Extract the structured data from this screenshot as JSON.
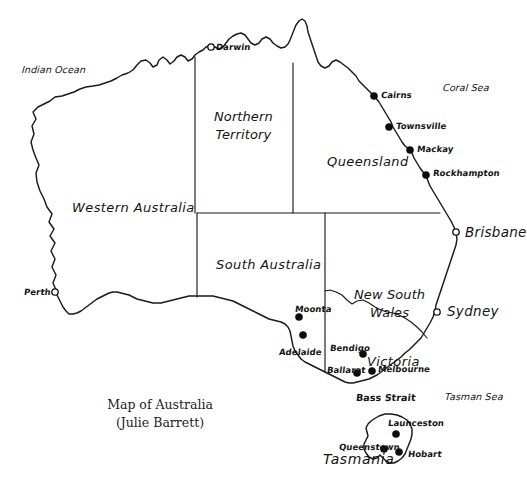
{
  "title": {
    "line1": "Map of Australia",
    "line2": "(Julie Barrett)"
  },
  "colors": {
    "background": "#ffffff",
    "ink": "#1a1a1a",
    "marker_fill": "#0d0d0d"
  },
  "states": [
    {
      "name": "Western Australia",
      "label": "Western Australia",
      "x": 72,
      "y": 201
    },
    {
      "name": "Northern Territory",
      "line1": "Northern",
      "line2": "Territory",
      "x": 214,
      "y": 108
    },
    {
      "name": "South Australia",
      "label": "South Australia",
      "x": 216,
      "y": 258
    },
    {
      "name": "Queensland",
      "label": "Queensland",
      "x": 327,
      "y": 155
    },
    {
      "name": "New South Wales",
      "line1": "New South",
      "line2": "Wales",
      "x": 354,
      "y": 286
    },
    {
      "name": "Victoria",
      "label": "Victoria",
      "x": 367,
      "y": 355
    },
    {
      "name": "Tasmania",
      "label": "Tasmania",
      "x": 323,
      "y": 452
    }
  ],
  "seas": [
    {
      "name": "Indian Ocean",
      "label": "Indian Ocean",
      "x": 22,
      "y": 65
    },
    {
      "name": "Coral Sea",
      "label": "Coral Sea",
      "x": 443,
      "y": 83
    },
    {
      "name": "Tasman Sea",
      "label": "Tasman Sea",
      "x": 445,
      "y": 392
    },
    {
      "name": "Bass Strait",
      "label": "Bass Strait",
      "x": 356,
      "y": 393
    }
  ],
  "cities": [
    {
      "name": "Darwin",
      "label": "Darwin",
      "marker": "hollow",
      "mx": 211,
      "my": 47,
      "lx": 216,
      "ly": 43,
      "size": "small"
    },
    {
      "name": "Cairns",
      "label": "Cairns",
      "marker": "filled",
      "mx": 374,
      "my": 96,
      "lx": 381,
      "ly": 91,
      "size": "small"
    },
    {
      "name": "Townsville",
      "label": "Townsville",
      "marker": "filled",
      "mx": 389,
      "my": 127,
      "lx": 396,
      "ly": 122,
      "size": "small"
    },
    {
      "name": "Mackay",
      "label": "Mackay",
      "marker": "filled",
      "mx": 410,
      "my": 150,
      "lx": 417,
      "ly": 145,
      "size": "small"
    },
    {
      "name": "Rockhampton",
      "label": "Rockhampton",
      "marker": "filled",
      "mx": 426,
      "my": 175,
      "lx": 433,
      "ly": 169,
      "size": "small"
    },
    {
      "name": "Brisbane",
      "label": "Brisbane",
      "marker": "hollow",
      "mx": 456,
      "my": 232,
      "lx": 465,
      "ly": 226,
      "size": "big"
    },
    {
      "name": "Sydney",
      "label": "Sydney",
      "marker": "hollow",
      "mx": 437,
      "my": 312,
      "lx": 447,
      "ly": 305,
      "size": "big"
    },
    {
      "name": "Perth",
      "label": "Perth",
      "marker": "hollow",
      "mx": 55,
      "my": 292,
      "lx": 24,
      "ly": 288,
      "size": "small"
    },
    {
      "name": "Moonta",
      "label": "Moonta",
      "marker": "filled",
      "mx": 299,
      "my": 317,
      "lx": 295,
      "ly": 305,
      "size": "small"
    },
    {
      "name": "Adelaide",
      "label": "Adelaide",
      "marker": "filled",
      "mx": 303,
      "my": 335,
      "lx": 279,
      "ly": 348,
      "size": "small"
    },
    {
      "name": "Bendigo",
      "label": "Bendigo",
      "marker": "filled",
      "mx": 363,
      "my": 354,
      "lx": 330,
      "ly": 344,
      "size": "small"
    },
    {
      "name": "Ballarat",
      "label": "Ballarat",
      "marker": "filled",
      "mx": 357,
      "my": 373,
      "lx": 327,
      "ly": 366,
      "size": "small"
    },
    {
      "name": "Melbourne",
      "label": "Melbourne",
      "marker": "filled",
      "mx": 372,
      "my": 371,
      "lx": 378,
      "ly": 365,
      "size": "small"
    },
    {
      "name": "Launceston",
      "label": "Launceston",
      "marker": "filled",
      "mx": 396,
      "my": 434,
      "lx": 388,
      "ly": 419,
      "size": "small"
    },
    {
      "name": "Queenstown",
      "label": "Queenstown",
      "marker": "filled",
      "mx": 384,
      "my": 449,
      "lx": 339,
      "ly": 443,
      "size": "small"
    },
    {
      "name": "Hobart",
      "label": "Hobart",
      "marker": "filled",
      "mx": 399,
      "my": 452,
      "lx": 408,
      "ly": 450,
      "size": "small"
    }
  ],
  "geometry": {
    "mainland": "M 56 290 L 53 283 L 56 275 L 52 267 L 55 259 L 51 251 L 55 243 L 50 236 L 54 229 L 49 222 L 52 214 L 47 207 L 44 199 L 40 191 L 37 182 L 36 173 L 39 165 L 36 158 L 33 150 L 31 142 L 34 134 L 32 126 L 36 119 L 33 112 L 38 107 L 44 104 L 50 101 L 55 97 L 62 96 L 68 94 L 74 92 L 80 89 L 86 87 L 93 86 L 99 85 L 105 83 L 111 81 L 117 78 L 122 75 L 128 73 L 133 70 L 137 65 L 141 61 L 146 60 L 150 63 L 153 67 L 157 65 L 159 60 L 163 57 L 167 60 L 170 64 L 174 61 L 177 57 L 181 55 L 185 57 L 188 61 L 192 59 L 195 55 L 199 52 L 203 50 L 206 47 L 210 46 L 215 47 L 219 49 L 223 47 L 226 43 L 229 39 L 233 36 L 237 34 L 241 33 L 245 35 L 248 39 L 251 43 L 255 45 L 259 43 L 262 39 L 266 37 L 270 39 L 273 43 L 277 46 L 281 48 L 285 47 L 288 44 L 290 40 L 292 35 L 294 30 L 296 25 L 299 21 L 302 19 L 305 21 L 307 26 L 308 32 L 310 38 L 312 44 L 314 50 L 316 56 L 318 62 L 321 66 L 325 68 L 329 66 L 332 62 L 336 60 L 340 62 L 344 65 L 348 68 L 352 72 L 356 76 L 359 81 L 363 85 L 367 89 L 371 93 L 375 97 L 379 102 L 382 107 L 385 112 L 388 117 L 391 122 L 393 127 L 396 132 L 399 137 L 402 142 L 405 146 L 409 149 L 412 153 L 414 158 L 417 163 L 420 168 L 423 172 L 426 176 L 428 181 L 430 186 L 433 191 L 436 196 L 439 201 L 442 206 L 445 211 L 448 216 L 451 221 L 454 227 L 456 233 L 457 239 L 456 245 L 454 251 L 452 257 L 450 263 L 448 269 L 446 275 L 444 281 L 442 287 L 440 293 L 438 299 L 436 305 L 435 311 L 433 317 L 430 323 L 427 328 L 424 333 L 421 338 L 417 342 L 413 346 L 409 350 L 405 353 L 401 357 L 397 360 L 393 363 L 389 366 L 385 369 L 381 372 L 377 375 L 373 377 L 369 379 L 365 380 L 361 381 L 357 382 L 353 383 L 349 383 L 345 382 L 341 380 L 337 378 L 333 376 L 329 374 L 325 372 L 321 370 L 317 368 L 313 366 L 309 364 L 305 362 L 301 359 L 298 355 L 295 351 L 293 346 L 292 341 L 291 336 L 290 331 L 288 327 L 285 324 L 281 322 L 277 321 L 273 320 L 269 319 L 265 317 L 261 315 L 257 313 L 253 311 L 249 309 L 245 307 L 241 305 L 237 303 L 233 301 L 229 300 L 225 299 L 221 298 L 217 297 L 213 296 L 209 296 L 205 296 L 201 296 L 197 296 L 193 296 L 189 296 L 185 297 L 181 298 L 177 299 L 173 300 L 169 301 L 165 302 L 161 303 L 157 303 L 153 303 L 149 302 L 145 301 L 141 300 L 137 299 L 133 297 L 129 295 L 125 294 L 121 293 L 117 292 L 113 292 L 109 293 L 105 295 L 101 297 L 97 299 L 93 302 L 89 305 L 85 308 L 81 311 L 77 313 L 73 314 L 69 314 L 66 311 L 63 307 L 61 303 L 59 299 L 57 295 Z",
    "tasmania": "M 374 419 L 379 416 L 385 414 L 391 414 L 397 415 L 402 417 L 407 420 L 410 424 L 412 429 L 412 434 L 411 439 L 409 444 L 407 449 L 405 454 L 402 458 L 398 461 L 394 463 L 390 463 L 386 461 L 383 458 L 380 455 L 377 458 L 373 459 L 369 457 L 366 453 L 364 449 L 364 444 L 366 440 L 368 436 L 367 432 L 366 428 L 368 424 L 371 421 Z",
    "borders": [
      "M 195 57 L 195 213",
      "M 293 63 L 293 213",
      "M 197 213 L 440 213",
      "M 197 213 L 197 297",
      "M 325 213 L 325 372",
      "M 325 291 L 330 290 L 336 292 L 342 295 L 347 300 L 352 304 L 357 301 L 363 300 L 369 303 L 375 307 L 381 310 L 387 312 L 393 313 L 399 315 L 405 318 L 411 322 L 417 327 L 422 332 L 427 338"
    ]
  }
}
